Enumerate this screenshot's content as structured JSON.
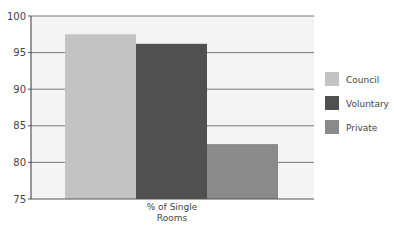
{
  "chart_data": {
    "type": "bar",
    "title": "",
    "xlabel": "",
    "ylabel": "",
    "categories": [
      "% of Single Rooms"
    ],
    "category_label_lines": [
      "% of Single",
      "Rooms"
    ],
    "series": [
      {
        "name": "Council",
        "values": [
          97.5
        ],
        "color": "#c3c3c3"
      },
      {
        "name": "Voluntary",
        "values": [
          96.2
        ],
        "color": "#505050"
      },
      {
        "name": "Private",
        "values": [
          82.5
        ],
        "color": "#8a8a8a"
      }
    ],
    "ylim": [
      75,
      100
    ],
    "yticks": [
      75,
      80,
      85,
      90,
      95,
      100
    ],
    "grid": true,
    "legend_position": "right"
  }
}
